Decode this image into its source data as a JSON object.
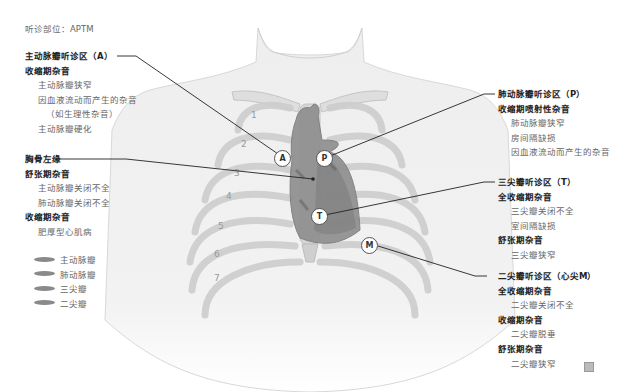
{
  "header": {
    "label": "听诊部位：APTM"
  },
  "left_panel": {
    "aortic": {
      "title": "主动脉瓣听诊区（A）",
      "phase1": "收缩期杂音",
      "items": [
        "主动脉瓣狭窄",
        "因血液流动而产生的杂音",
        "（如生理性杂音）",
        "主动脉瓣硬化"
      ]
    },
    "sternal": {
      "title": "胸骨左缘",
      "phase1": "舒张期杂音",
      "items1": [
        "主动脉瓣关闭不全",
        "肺动脉瓣关闭不全"
      ],
      "phase2": "收缩期杂音",
      "items2": [
        "肥厚型心肌病"
      ]
    }
  },
  "legend": {
    "items": [
      {
        "label": "主动脉瓣",
        "color": "#8a8a8a"
      },
      {
        "label": "肺动脉瓣",
        "color": "#8a8a8a"
      },
      {
        "label": "三尖瓣",
        "color": "#8a8a8a"
      },
      {
        "label": "二尖瓣",
        "color": "#8a8a8a"
      }
    ]
  },
  "right_panel": {
    "pulmonic": {
      "title": "肺动脉瓣听诊区（P）",
      "phase1": "收缩期喷射性杂音",
      "items": [
        "肺动脉瓣狭窄",
        "房间隔缺损",
        "因血液流动而产生的杂音"
      ]
    },
    "tricuspid": {
      "title": "三尖瓣听诊区（T）",
      "phase1": "全收缩期杂音",
      "items1": [
        "三尖瓣关闭不全",
        "室间隔缺损"
      ],
      "phase2": "舒张期杂音",
      "items2": [
        "三尖瓣狭窄"
      ]
    },
    "mitral": {
      "title": "二尖瓣听诊区（心尖M）",
      "phase1": "全收缩期杂音",
      "items1": [
        "二尖瓣关闭不全"
      ],
      "phase2": "收缩期杂音",
      "items2": [
        "二尖瓣脱垂"
      ],
      "phase3": "舒张期杂音",
      "items3": [
        "二尖瓣狭窄"
      ]
    }
  },
  "markers": {
    "A": "A",
    "P": "P",
    "T": "T",
    "M": "M"
  },
  "rib_numbers": [
    "1",
    "2",
    "3",
    "4",
    "5",
    "6",
    "7"
  ],
  "colors": {
    "body_fill": "#ececec",
    "rib_fill": "#dcdcdc",
    "heart_fill": "#8f8f8f",
    "heart_dark": "#6e6e6e",
    "leader_line": "#222222"
  }
}
